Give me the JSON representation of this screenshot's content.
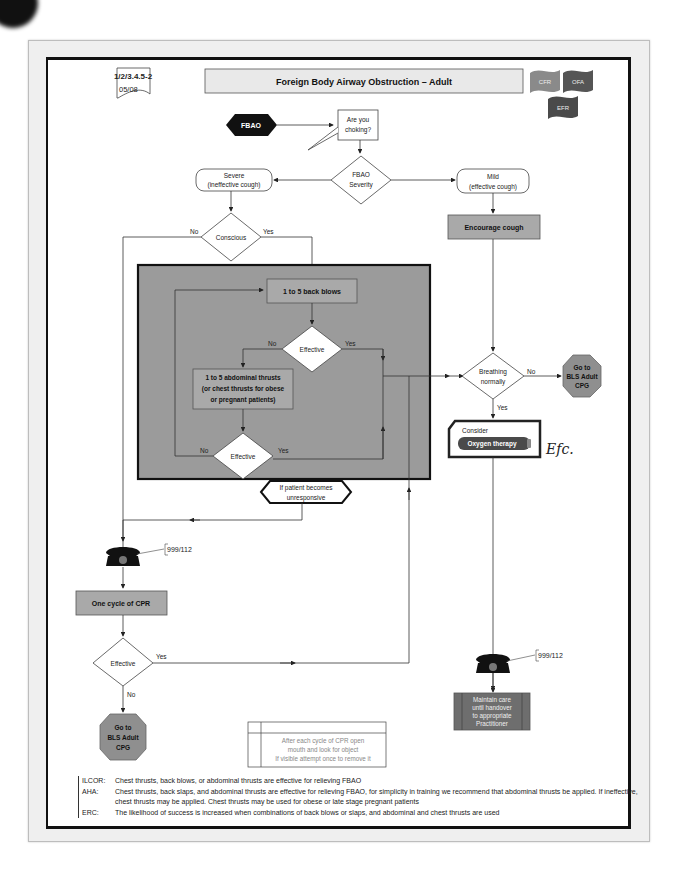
{
  "header": {
    "code": "1/2/3.4.5-2",
    "date": "05/08",
    "title": "Foreign Body Airway Obstruction – Adult",
    "flags": [
      {
        "label": "CFR",
        "color": "#8a8a8a"
      },
      {
        "label": "OFA",
        "color": "#555555"
      },
      {
        "label": "EFR",
        "color": "#4a4a4a"
      }
    ]
  },
  "flow": {
    "start": "FBAO",
    "ask_line1": "Are you",
    "ask_line2": "choking?",
    "severity_line1": "FBAO",
    "severity_line2": "Severity",
    "severe_line1": "Severe",
    "severe_line2": "(ineffective cough)",
    "mild_line1": "Mild",
    "mild_line2": "(effective cough)",
    "conscious": "Conscious",
    "no": "No",
    "yes": "Yes",
    "back_blows": "1 to 5 back blows",
    "effective": "Effective",
    "thrusts_line1": "1 to 5 abdominal thrusts",
    "thrusts_line2": "(or chest thrusts for obese",
    "thrusts_line3": "or pregnant patients)",
    "unresponsive_line1": "If patient becomes",
    "unresponsive_line2": "unresponsive",
    "encourage_cough": "Encourage cough",
    "breathing_line1": "Breathing",
    "breathing_line2": "normally",
    "goto_line1": "Go to",
    "goto_line2": "BLS Adult",
    "goto_line3": "CPG",
    "consider": "Consider",
    "oxygen": "Oxygen therapy",
    "handwritten": "Efc.",
    "phone_number": "999/112",
    "cpr_cycle": "One cycle of CPR",
    "maintain_line1": "Maintain care",
    "maintain_line2": "until handover",
    "maintain_line3": "to appropriate",
    "maintain_line4": "Practitioner",
    "tip_line1": "After each cycle of CPR open",
    "tip_line2": "mouth and look for object",
    "tip_line3": "If visible attempt once to remove it"
  },
  "notes": [
    {
      "key": "ILCOR:",
      "text": "Chest thrusts, back blows, or abdominal thrusts are effective for relieving FBAO"
    },
    {
      "key": "AHA:",
      "text": "Chest thrusts, back slaps, and abdominal thrusts are effective for relieving FBAO, for simplicity in training we recommend that abdominal thrusts be applied. If ineffective, chest thrusts may be applied. Chest thrusts may be used for obese or late stage pregnant patients"
    },
    {
      "key": "ERC:",
      "text": "The likelihood of success is increased when combinations of back blows or slaps, and abdominal and chest thrusts are used"
    }
  ],
  "colors": {
    "box_grey": "#a9a9a9",
    "panel_grey": "#9b9b9b",
    "octagon_grey": "#8f8f8f",
    "maintain_fill": "#6e6e6e",
    "oxygen_fill": "#4a4a4a"
  }
}
